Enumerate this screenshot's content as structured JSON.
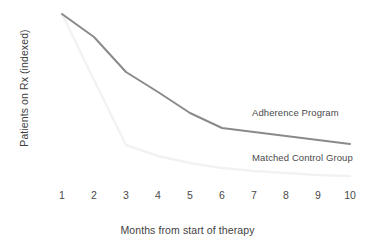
{
  "chart_data": {
    "type": "line",
    "title": "",
    "xlabel": "Months from start of therapy",
    "ylabel": "Patients on Rx (indexed)",
    "x": [
      1,
      2,
      3,
      4,
      5,
      6,
      7,
      8,
      9,
      10
    ],
    "xtick_labels": [
      "1",
      "2",
      "3",
      "4",
      "5",
      "6",
      "7",
      "8",
      "9",
      "10"
    ],
    "ytick_labels": [],
    "xlim": [
      1,
      10
    ],
    "ylim": [
      0,
      100
    ],
    "grid": false,
    "legend_position": "inline-right",
    "series": [
      {
        "name": "Adherence Program",
        "color": "#8a8a8a",
        "line_width": 2.0,
        "values": [
          100,
          86,
          75,
          57,
          42,
          30,
          24,
          21,
          18,
          15
        ]
      },
      {
        "name": "Matched Control Group",
        "color": "#f2f2f2",
        "line_width": 2.4,
        "values": [
          100,
          55,
          20,
          13,
          10,
          7,
          6,
          5,
          4.5,
          4
        ]
      }
    ],
    "annotations": [
      {
        "text": "Adherence Program",
        "series": "Adherence Program"
      },
      {
        "text": "Matched Control Group",
        "series": "Matched Control Group"
      }
    ]
  },
  "geometry": {
    "x_pixels": [
      62,
      94,
      126,
      158,
      190,
      222,
      254,
      286,
      318,
      350
    ],
    "adherence_y_pixels": [
      14,
      37,
      72,
      92,
      113,
      128,
      132,
      136,
      140,
      144
    ],
    "control_y_pixels": [
      14,
      80,
      145,
      156,
      163,
      168,
      171,
      173,
      175,
      176
    ]
  },
  "colors": {
    "background": "#ffffff",
    "adherence": "#8a8a8a",
    "control": "#f2f2f2",
    "text": "#444444"
  }
}
